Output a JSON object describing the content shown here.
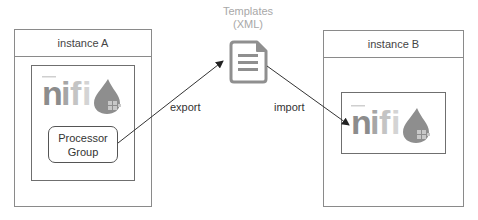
{
  "template": {
    "title_line1": "Templates",
    "title_line2": "(XML)",
    "icon": "document-icon"
  },
  "instance_a": {
    "title": "instance A",
    "logo_text": "nifi",
    "logo_icon": "nifi-drop-logo",
    "processor_group": {
      "line1": "Processor",
      "line2": "Group"
    }
  },
  "instance_b": {
    "title": "instance B",
    "logo_text": "nifi",
    "logo_icon": "nifi-drop-logo"
  },
  "arrows": {
    "export_label": "export",
    "import_label": "import"
  },
  "colors": {
    "border": "#8a8a8a",
    "logo_dark": "#8c8c8c",
    "logo_light": "#c8c8c8",
    "template_gray": "#8f8f8f",
    "arrow": "#333333"
  }
}
